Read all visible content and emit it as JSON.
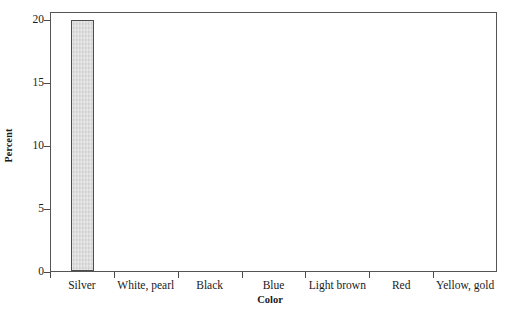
{
  "chart_data": {
    "type": "bar",
    "title": "",
    "xlabel": "Color",
    "ylabel": "Percent",
    "categories": [
      "Silver",
      "White, pearl",
      "Black",
      "Blue",
      "Light brown",
      "Red",
      "Yellow, gold"
    ],
    "values": [
      20,
      0,
      0,
      0,
      0,
      0,
      0
    ],
    "value_labels": [
      "20",
      "0",
      "0",
      "0",
      "0",
      "0",
      "0"
    ],
    "ylim": [
      0,
      20.6
    ],
    "yticks": [
      0,
      5,
      10,
      15,
      20
    ],
    "ytick_labels": [
      "0",
      "5",
      "10",
      "15",
      "20"
    ],
    "grid": false,
    "legend": null,
    "bar_color": "#d9d9d9",
    "bar_edge_color": "#4c4c4c",
    "axis_color": "#555555",
    "text_color": "#1a1a1a",
    "background": "#ffffff"
  }
}
